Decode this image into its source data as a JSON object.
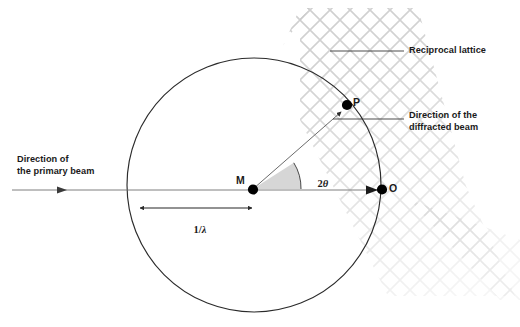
{
  "figure": {
    "type": "ewald-sphere-construction",
    "background_color": "#ffffff"
  },
  "labels": {
    "reciprocal_lattice": "Reciprocal lattice",
    "diffracted_beam_line1": "Direction of the",
    "diffracted_beam_line2": "diffracted beam",
    "primary_beam_line1": "Direction of",
    "primary_beam_line2": "the primary beam",
    "point_m": "M",
    "point_o": "O",
    "point_p": "P",
    "radius_label_num": "1/",
    "radius_label_sym": "λ",
    "angle_label_num": "2",
    "angle_label_sym": "θ"
  },
  "colors": {
    "stroke_main": "#2b2b2b",
    "stroke_thin": "#555555",
    "lattice": "#c9c9c9",
    "angle_fill": "#d4d4d4",
    "text": "#1a1a1a",
    "dot": "#000000"
  },
  "geometry": {
    "circle": {
      "cx": 254,
      "cy": 185,
      "r": 127
    },
    "point_m": {
      "x": 253,
      "y": 189
    },
    "point_o": {
      "x": 381,
      "y": 189
    },
    "point_p": {
      "x": 347,
      "y": 105
    },
    "primary_beam": {
      "x1": 12,
      "y1": 190,
      "x2": 381,
      "y2": 190
    },
    "radius_dim": {
      "x1": 139,
      "y": 208,
      "x2": 253
    },
    "angle_deg": 33
  }
}
